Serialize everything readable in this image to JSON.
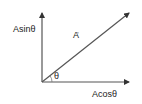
{
  "diagram": {
    "type": "vector-components",
    "colors": {
      "line": "#444444",
      "text": "#222222",
      "background": "#ffffff"
    },
    "labels": {
      "vertical_component": "Asinθ",
      "vector": "A",
      "vector_arrow": "→",
      "angle": "θ",
      "horizontal_component": "Acosθ"
    }
  }
}
